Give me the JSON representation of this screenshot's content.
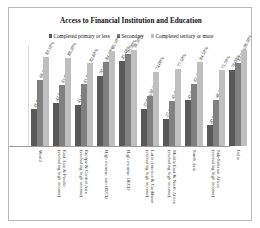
{
  "chart_data": {
    "type": "bar",
    "title": "Access to Financial Institution and Education",
    "xlabel": "",
    "ylabel": "",
    "ylim": [
      0,
      100
    ],
    "grid": false,
    "legend_position": "top-center",
    "value_suffix": "%",
    "colors": {
      "series1": "#595959",
      "series2": "#808080",
      "series3": "#bfbfbf",
      "frame": "#b9b9b9",
      "axis": "#9a9a9a",
      "text": "#111111"
    },
    "categories": [
      "World",
      "East Asia & Pacific (excluding high income)",
      "Europe & Central Asia (excluding high income)",
      "High income: non OECD",
      "High income: OECD",
      "Latin America & Caribbean (excluding high income)",
      "Middle East & North Africa (excluding high income)",
      "South Asia",
      "Sub-Saharan Africa (excluding high income)",
      "India"
    ],
    "category_lines": [
      [
        "World",
        ""
      ],
      [
        "East Asia & Pacific",
        "(excluding high income)"
      ],
      [
        "Europe & Central Asia",
        "(excluding high income)"
      ],
      [
        "High income: non OECD",
        ""
      ],
      [
        "High income: OECD",
        ""
      ],
      [
        "Latin America & Caribbean",
        "(excluding high income)"
      ],
      [
        "Middle East & North Africa",
        "(excluding high income)"
      ],
      [
        "South Asia",
        ""
      ],
      [
        "Sub-Saharan Africa",
        "(excluding high income)"
      ],
      [
        "India",
        ""
      ]
    ],
    "series": [
      {
        "name": "Completed primary or less",
        "values": [
          36.8,
          43.5,
          41.4,
          70.1,
          85.4,
          37.0,
          27.1,
          45.9,
          20.7,
          76.0
        ],
        "labels": [
          "36.80%",
          "43.50%",
          "41.40%",
          "70.10%",
          "85.40%",
          "37.00%",
          "27.10%",
          "45.90%",
          "20.70%",
          "76.00%"
        ]
      },
      {
        "name": "Secondary",
        "values": [
          66.5,
          61.0,
          61.8,
          84.4,
          91.9,
          50.2,
          45.0,
          62.4,
          46.2,
          83.5
        ],
        "labels": [
          "66.50%",
          "61.00%",
          "61.80%",
          "84.40%",
          "91.90%",
          "50.20%",
          "45.00%",
          "62.40%",
          "46.20%",
          "83.50%"
        ]
      },
      {
        "name": "Completed tertiary or more",
        "values": [
          89.1,
          88.2,
          82.6,
          95.1,
          96.3,
          74.0,
          77.5,
          84.5,
          75.7,
          96.3
        ],
        "labels": [
          "89.10%",
          "88.20%",
          "82.60%",
          "95.10%",
          "96.30%",
          "74.00%",
          "77.50%",
          "84.50%",
          "75.70%",
          "96.30%"
        ]
      }
    ]
  }
}
